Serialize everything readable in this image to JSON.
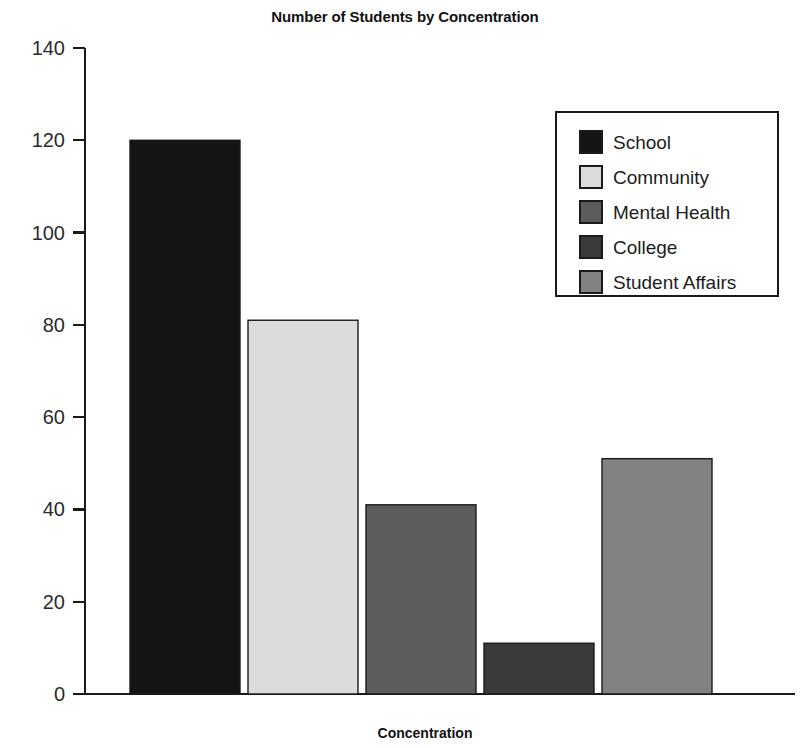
{
  "chart_data": {
    "type": "bar",
    "title": "Number of Students by Concentration",
    "xlabel": "Concentration",
    "ylabel": "",
    "categories": [
      "School",
      "Community",
      "Mental Health",
      "College",
      "Student Affairs"
    ],
    "values": [
      120,
      81,
      41,
      11,
      51
    ],
    "ylim": [
      0,
      140
    ],
    "yticks": [
      0,
      20,
      40,
      60,
      80,
      100,
      120,
      140
    ],
    "ytick_labels": [
      "0",
      "20",
      "40",
      "60",
      "80",
      "100",
      "120",
      "140"
    ],
    "xtick_labels": [],
    "grid": false,
    "legend_position": "upper right",
    "series": [
      {
        "name": "School",
        "value": 120,
        "color": "#141414"
      },
      {
        "name": "Community",
        "value": 81,
        "color": "#dcdcdc"
      },
      {
        "name": "Mental Health",
        "value": 41,
        "color": "#5c5c5c"
      },
      {
        "name": "College",
        "value": 11,
        "color": "#3a3a3a"
      },
      {
        "name": "Student Affairs",
        "value": 51,
        "color": "#828282"
      }
    ],
    "colors": {
      "axis": "#1a1a1a",
      "text": "#1d1d1d",
      "background": "#ffffff",
      "bar_outline": "#1a1a1a"
    }
  },
  "legend": {
    "items": [
      {
        "label": "School"
      },
      {
        "label": "Community"
      },
      {
        "label": "Mental Health"
      },
      {
        "label": "College"
      },
      {
        "label": "Student Affairs"
      }
    ]
  }
}
